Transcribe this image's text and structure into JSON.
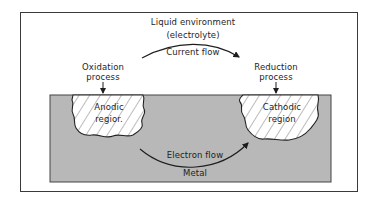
{
  "diagram": {
    "environment": {
      "line1": "Liquid environment",
      "line2": "(electrolyte)"
    },
    "current_flow": "Current flow",
    "oxidation": {
      "line1": "Oxidation",
      "line2": "process"
    },
    "reduction": {
      "line1": "Reduction",
      "line2": "process"
    },
    "anodic": {
      "line1": "Anodic",
      "line2": "regior."
    },
    "cathodic": {
      "line1": "Cathodic",
      "line2": "region"
    },
    "electron_flow": "Electron flow",
    "metal": "Metal",
    "colors": {
      "metal_fill": "#b8b8b8",
      "frame_stroke": "#3a3a3a",
      "region_fill": "#ffffff",
      "line": "#1e1e1e"
    }
  }
}
